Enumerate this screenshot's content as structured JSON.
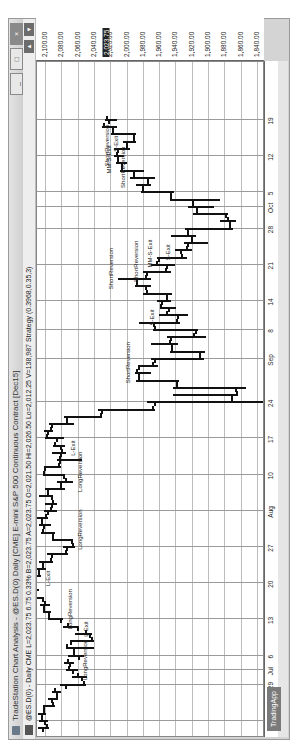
{
  "window": {
    "title": "TradeStation Chart Analysis - @ES.D(0) Daily [CME] E-mini S&P 500 Continuous Contract [Dec15]",
    "buttons": {
      "minimize": "_",
      "restore": "□",
      "close": "×"
    }
  },
  "infobar": {
    "text": "@ES.D(0) - Daily  CME  L=2,023.75  6.75  0.33%  B=2,023.75  A=2,023.75  O=2,021.50  Hi=2,026.50  Lo=2,012.25  V=138,987  Strategy (0.3968,0.35,3)"
  },
  "app_tab": "TradingApp",
  "colors": {
    "current_price_bg": "#222222",
    "bars": "#111111",
    "grid": "#9a9a9a"
  },
  "chart_data": {
    "type": "ohlc",
    "title": "@ES.D(0) Daily [CME] E-mini S&P 500 Continuous Contract [Dec15]",
    "xlabel": "Date",
    "ylabel": "Price",
    "ylim": [
      1830,
      2110
    ],
    "y_ticks": [
      "2,100.00",
      "2,080.00",
      "2,060.00",
      "2,040.00",
      "2,020.00",
      "2,000.00",
      "1,980.00",
      "1,960.00",
      "1,940.00",
      "1,920.00",
      "1,900.00",
      "1,880.00",
      "1,860.00",
      "1,840.00"
    ],
    "current_price_label": "2,023.75",
    "x_ticks": [
      "22",
      "29",
      "Jul",
      "6",
      "13",
      "20",
      "27",
      "Aug",
      "10",
      "17",
      "24",
      "Sep",
      "8",
      "14",
      "21",
      "28",
      "Oct",
      "5",
      "12",
      "19"
    ],
    "grid": true,
    "last_bar": {
      "open": 2021.5,
      "high": 2026.5,
      "low": 2012.25,
      "close": 2023.75,
      "change": 6.75,
      "change_pct": "0.33%",
      "volume": 138987
    },
    "annotations": [
      {
        "text": "LongReversion",
        "approx_date": "Jul 1"
      },
      {
        "text": "L-Exit",
        "approx_date": "Jul 10"
      },
      {
        "text": "LongReversion",
        "approx_date": "Jul 13"
      },
      {
        "text": "L-Exit",
        "approx_date": "Jul 21"
      },
      {
        "text": "LongReversion",
        "approx_date": "Jul 28"
      },
      {
        "text": "LongReversion",
        "approx_date": "Aug 7"
      },
      {
        "text": "L-Exit",
        "approx_date": "Aug 14"
      },
      {
        "text": "ShortReversion",
        "approx_date": "Aug 28"
      },
      {
        "text": "S-Exit",
        "approx_date": "Sep 10"
      },
      {
        "text": "ShortReversion",
        "approx_date": "Sep 17"
      },
      {
        "text": "ShortReversion",
        "approx_date": "Sep 18"
      },
      {
        "text": "MM-S-Exit",
        "approx_date": "Sep 22"
      },
      {
        "text": "S-Exit",
        "approx_date": "Sep 23"
      },
      {
        "text": "ShortReversion",
        "approx_date": "Oct 7"
      },
      {
        "text": "ShortReversion",
        "approx_date": "Oct 12"
      },
      {
        "text": "MM-S-Exit",
        "approx_date": "Oct 9"
      },
      {
        "text": "S-Exit",
        "approx_date": "Oct 14"
      }
    ],
    "series": [
      {
        "name": "@ES.D(0) Daily",
        "approx_ohlc": [
          [
            "Jun 19",
            2103,
            2109,
            2095,
            2098
          ],
          [
            "Jun 22",
            2100,
            2108,
            2096,
            2104
          ],
          [
            "Jun 23",
            2104,
            2109,
            2099,
            2101
          ],
          [
            "Jun 24",
            2101,
            2103,
            2088,
            2090
          ],
          [
            "Jun 25",
            2091,
            2097,
            2084,
            2085
          ],
          [
            "Jun 26",
            2086,
            2092,
            2080,
            2088
          ],
          [
            "Jun 29",
            2075,
            2082,
            2050,
            2052
          ],
          [
            "Jun 30",
            2055,
            2067,
            2048,
            2060
          ],
          [
            "Jul 1",
            2066,
            2075,
            2060,
            2071
          ],
          [
            "Jul 2",
            2070,
            2077,
            2064,
            2072
          ],
          [
            "Jul 6",
            2058,
            2072,
            2052,
            2065
          ],
          [
            "Jul 7",
            2065,
            2075,
            2040,
            2073
          ],
          [
            "Jul 8",
            2068,
            2070,
            2040,
            2042
          ],
          [
            "Jul 9",
            2045,
            2063,
            2042,
            2050
          ],
          [
            "Jul 10",
            2060,
            2078,
            2058,
            2072
          ],
          [
            "Jul 13",
            2080,
            2096,
            2078,
            2095
          ],
          [
            "Jul 14",
            2095,
            2103,
            2093,
            2101
          ],
          [
            "Jul 15",
            2101,
            2106,
            2094,
            2100
          ],
          [
            "Jul 16",
            2103,
            2114,
            2101,
            2113
          ],
          [
            "Jul 17",
            2113,
            2117,
            2108,
            2115
          ],
          [
            "Jul 20",
            2115,
            2120,
            2110,
            2116
          ],
          [
            "Jul 21",
            2114,
            2118,
            2105,
            2107
          ],
          [
            "Jul 22",
            2107,
            2110,
            2099,
            2103
          ],
          [
            "Jul 23",
            2103,
            2108,
            2090,
            2093
          ],
          [
            "Jul 24",
            2092,
            2098,
            2072,
            2075
          ],
          [
            "Jul 27",
            2073,
            2078,
            2063,
            2066
          ],
          [
            "Jul 28",
            2067,
            2092,
            2066,
            2090
          ],
          [
            "Jul 29",
            2090,
            2105,
            2088,
            2103
          ],
          [
            "Jul 30",
            2102,
            2108,
            2093,
            2104
          ],
          [
            "Jul 31",
            2104,
            2110,
            2097,
            2099
          ],
          [
            "Aug 3",
            2097,
            2102,
            2085,
            2093
          ],
          [
            "Aug 4",
            2092,
            2100,
            2085,
            2090
          ],
          [
            "Aug 5",
            2092,
            2107,
            2090,
            2097
          ],
          [
            "Aug 6",
            2097,
            2100,
            2075,
            2080
          ],
          [
            "Aug 7",
            2080,
            2085,
            2066,
            2075
          ],
          [
            "Aug 10",
            2077,
            2103,
            2075,
            2101
          ],
          [
            "Aug 11",
            2100,
            2102,
            2080,
            2083
          ],
          [
            "Aug 12",
            2082,
            2085,
            2055,
            2082
          ],
          [
            "Aug 13",
            2081,
            2092,
            2074,
            2079
          ],
          [
            "Aug 14",
            2080,
            2090,
            2075,
            2088
          ],
          [
            "Aug 17",
            2085,
            2100,
            2077,
            2098
          ],
          [
            "Aug 18",
            2097,
            2101,
            2090,
            2093
          ],
          [
            "Aug 19",
            2092,
            2095,
            2065,
            2073
          ],
          [
            "Aug 20",
            2073,
            2077,
            2030,
            2032
          ],
          [
            "Aug 21",
            2030,
            2035,
            1965,
            1967
          ],
          [
            "Aug 24",
            1965,
            1975,
            1831,
            1871
          ],
          [
            "Aug 25",
            1871,
            1943,
            1863,
            1865
          ],
          [
            "Aug 26",
            1866,
            1943,
            1853,
            1938
          ],
          [
            "Aug 27",
            1938,
            1989,
            1935,
            1985
          ],
          [
            "Aug 28",
            1985,
            1990,
            1970,
            1987
          ],
          [
            "Aug 31",
            1985,
            1986,
            1961,
            1967
          ],
          [
            "Sep 1",
            1965,
            1970,
            1905,
            1910
          ],
          [
            "Sep 2",
            1910,
            1947,
            1904,
            1944
          ],
          [
            "Sep 3",
            1944,
            1970,
            1937,
            1947
          ],
          [
            "Sep 4",
            1946,
            1950,
            1903,
            1917
          ],
          [
            "Sep 8",
            1915,
            1967,
            1912,
            1965
          ],
          [
            "Sep 9",
            1966,
            1985,
            1934,
            1938
          ],
          [
            "Sep 10",
            1937,
            1960,
            1925,
            1950
          ],
          [
            "Sep 11",
            1948,
            1959,
            1939,
            1958
          ],
          [
            "Sep 14",
            1957,
            1963,
            1945,
            1950
          ],
          [
            "Sep 15",
            1950,
            1980,
            1944,
            1975
          ],
          [
            "Sep 16",
            1976,
            1990,
            1970,
            1987
          ],
          [
            "Sep 17",
            1987,
            2010,
            1970,
            1976
          ],
          [
            "Sep 18",
            1975,
            1980,
            1945,
            1952
          ],
          [
            "Sep 21",
            1950,
            1970,
            1940,
            1963
          ],
          [
            "Sep 22",
            1960,
            1963,
            1926,
            1932
          ],
          [
            "Sep 23",
            1933,
            1941,
            1920,
            1926
          ],
          [
            "Sep 24",
            1925,
            1930,
            1900,
            1920
          ],
          [
            "Sep 25",
            1920,
            1945,
            1915,
            1925
          ],
          [
            "Sep 28",
            1925,
            1928,
            1869,
            1873
          ],
          [
            "Sep 29",
            1873,
            1885,
            1865,
            1876
          ],
          [
            "Sep 30",
            1878,
            1918,
            1876,
            1914
          ],
          [
            "Oct 1",
            1913,
            1925,
            1893,
            1919
          ],
          [
            "Oct 2",
            1918,
            1947,
            1885,
            1945
          ],
          [
            "Oct 5",
            1945,
            1982,
            1942,
            1980
          ],
          [
            "Oct 6",
            1980,
            1988,
            1970,
            1974
          ],
          [
            "Oct 7",
            1974,
            1996,
            1965,
            1991
          ],
          [
            "Oct 8",
            1991,
            2008,
            1979,
            2006
          ],
          [
            "Oct 9",
            2006,
            2013,
            2000,
            2010
          ],
          [
            "Oct 12",
            2010,
            2015,
            2003,
            2012
          ],
          [
            "Oct 13",
            2011,
            2015,
            1996,
            1999
          ],
          [
            "Oct 14",
            2000,
            2005,
            1988,
            1991
          ],
          [
            "Oct 15",
            1991,
            2019,
            1988,
            2017
          ],
          [
            "Oct 16",
            2017,
            2030,
            2012,
            2028
          ],
          [
            "Oct 19",
            2021.5,
            2026.5,
            2012.25,
            2023.75
          ]
        ]
      }
    ]
  }
}
